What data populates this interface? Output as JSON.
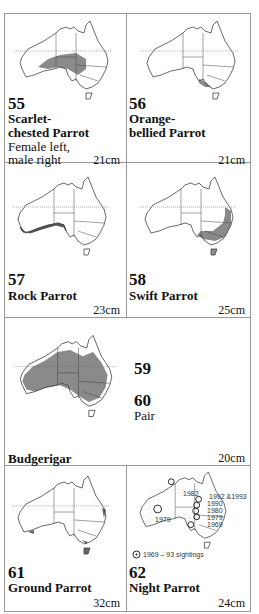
{
  "colors": {
    "range_fill": "#8a8a8a",
    "outline": "#444444",
    "border": "#999999"
  },
  "entries": [
    {
      "number": "55",
      "name_line1": "Scarlet-",
      "name_line2": "chested Parrot",
      "note_line1": "Female left,",
      "note_line2": "male right",
      "size": "21cm"
    },
    {
      "number": "56",
      "name_line1": "Orange-",
      "name_line2": "bellied Parrot",
      "size": "21cm"
    },
    {
      "number": "57",
      "name": "Rock Parrot",
      "size": "23cm"
    },
    {
      "number": "58",
      "name": "Swift Parrot",
      "size": "25cm"
    },
    {
      "number_a": "59",
      "number_b": "60",
      "note": "Pair",
      "name": "Budgerigar",
      "size": "20cm"
    },
    {
      "number": "61",
      "name": "Ground Parrot",
      "size": "32cm"
    },
    {
      "number": "62",
      "name": "Night Parrot",
      "size": "24cm",
      "sightings": [
        "1982",
        "1992 &1993",
        "1990",
        "1980",
        "1979",
        "1969",
        "1979"
      ],
      "legend": "1969 – 93 sightings"
    }
  ]
}
